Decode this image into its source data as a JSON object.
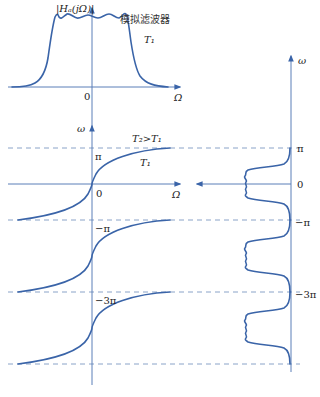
{
  "top_plot": {
    "y_label": "|Hₐ(jΩ)|",
    "x_label": "Ω",
    "origin_label": "0",
    "title": "模拟滤波器",
    "curve_label": "T₁"
  },
  "mapping_plot": {
    "y_label": "ω",
    "x_label": "Ω",
    "origin_label": "0",
    "curve_label_upper": "T₂>T₁",
    "curve_label_lower": "T₁",
    "level_labels": [
      "π",
      "−π",
      "−3π"
    ]
  },
  "right_plot": {
    "y_label": "ω",
    "tick_labels": [
      "π",
      "0",
      "−π",
      "−3π"
    ]
  },
  "colors": {
    "curve": "#3a64a8",
    "axis": "#5b7fb8",
    "dash": "#8aa3c8"
  }
}
